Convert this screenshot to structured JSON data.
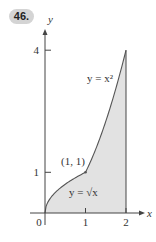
{
  "problem": {
    "number": "46."
  },
  "chart_data": {
    "type": "area",
    "title": "",
    "xlabel": "x",
    "ylabel": "y",
    "xlim": [
      0,
      2
    ],
    "ylim": [
      0,
      4
    ],
    "x_ticks": [
      {
        "value": 0,
        "label": "0"
      },
      {
        "value": 1,
        "label": "1"
      },
      {
        "value": 2,
        "label": "2"
      }
    ],
    "y_ticks": [
      {
        "value": 1,
        "label": "1"
      },
      {
        "value": 4,
        "label": "4"
      }
    ],
    "curves": [
      {
        "name": "y = √x",
        "domain": [
          0,
          1
        ],
        "label": "y = √x"
      },
      {
        "name": "y = x²",
        "domain": [
          1,
          2
        ],
        "label": "y = x²"
      }
    ],
    "boundary": {
      "vertical_line_x": 2
    },
    "annotations": [
      {
        "text": "(1, 1)",
        "x": 1,
        "y": 1
      }
    ],
    "shaded_region": "between x-axis, piecewise curve (√x on [0,1], x² on [1,2]) and x = 2",
    "grid": false,
    "colors": {
      "fill": "#e2e2e2",
      "curve": "#555555",
      "axis": "#444444"
    }
  }
}
